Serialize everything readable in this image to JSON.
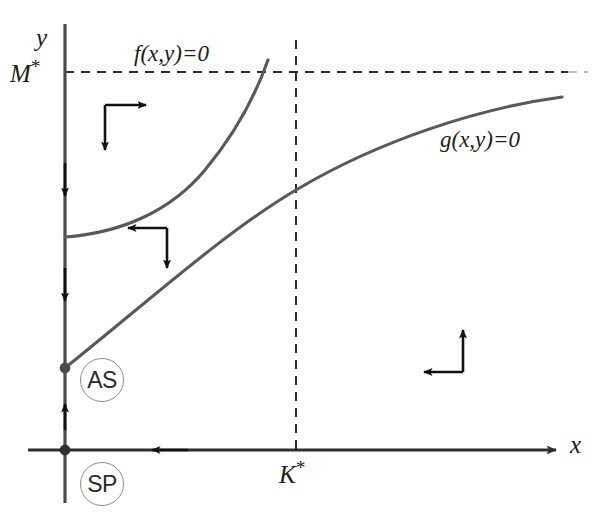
{
  "figure": {
    "background_color": "#ffffff",
    "curve_color": "#59595b",
    "axis_color": "#4a4a4c",
    "arrow_color": "#111111",
    "badge_color": "#8d8d8d",
    "width": 612,
    "height": 521
  },
  "axes": {
    "y_label": "y",
    "x_label": "x",
    "origin_label": "O",
    "y_axis_x_px": 65,
    "x_axis_y_px": 450
  },
  "ticks": {
    "y_tick_label": "M",
    "y_tick_superscript": "*",
    "y_tick_value_px": 72,
    "x_tick_label": "K",
    "x_tick_superscript": "*",
    "x_tick_value_px": 296
  },
  "nullclines": [
    {
      "name": "f-nullcline",
      "label": "f(x,y)=0",
      "label_x_px": 134,
      "label_y_px": 42,
      "shape": "convex-increasing",
      "start_px": [
        65,
        237
      ],
      "end_px": [
        268,
        60
      ]
    },
    {
      "name": "g-nullcline",
      "label": "g(x,y)=0",
      "label_x_px": 440,
      "label_y_px": 128,
      "shape": "concave-increasing",
      "start_px": [
        65,
        368
      ],
      "end_px": [
        562,
        97
      ]
    }
  ],
  "equilibria": [
    {
      "name": "asymptotically-stable",
      "label": "AS",
      "dot_px": [
        65,
        368
      ],
      "badge_px": [
        80,
        358
      ]
    },
    {
      "name": "saddle-point",
      "label": "SP",
      "dot_px": [
        65,
        450
      ],
      "badge_px": [
        80,
        462
      ]
    }
  ],
  "direction_fields": [
    {
      "name": "region-upper-left",
      "horizontal": "right",
      "vertical": "down",
      "x_px": 105,
      "y_px": 105
    },
    {
      "name": "region-middle",
      "horizontal": "left",
      "vertical": "down",
      "x_px": 125,
      "y_px": 228
    },
    {
      "name": "region-lower-right",
      "horizontal": "left",
      "vertical": "up",
      "x_px": 420,
      "y_px": 330
    }
  ],
  "flow_arrows": [
    {
      "name": "y-axis-flow-upper",
      "direction": "down",
      "x_px": 65,
      "y_px": 185
    },
    {
      "name": "y-axis-flow-lower",
      "direction": "down",
      "x_px": 65,
      "y_px": 290
    },
    {
      "name": "y-axis-flow-toward-as",
      "direction": "up",
      "x_px": 65,
      "y_px": 417
    },
    {
      "name": "x-axis-flow",
      "direction": "left",
      "x_px": 155,
      "y_px": 450
    }
  ],
  "guides": [
    {
      "name": "m-star-horizontal-dashed",
      "orientation": "horizontal",
      "y_px": 72,
      "from_px": 65,
      "to_px": 585
    },
    {
      "name": "k-star-vertical-dashed",
      "orientation": "vertical",
      "x_px": 296,
      "from_px": 40,
      "to_px": 450
    }
  ]
}
